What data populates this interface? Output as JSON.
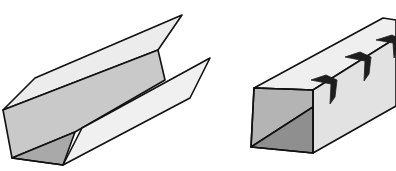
{
  "figure": {
    "colors": {
      "background": "#ffffff",
      "outline": "#111111",
      "face_light": "#ececec",
      "face_mid": "#cfcfcf",
      "face_dark": "#a9a9a9",
      "face_darker": "#8f8f8f",
      "tab": "#1e1e1e"
    },
    "items": [
      {
        "name": "open-u-channel",
        "label": ""
      },
      {
        "name": "closed-box-channel-with-tabs",
        "label": "",
        "tab_count": 3
      }
    ]
  }
}
